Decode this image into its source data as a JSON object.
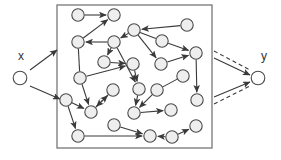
{
  "figure": {
    "type": "network-graph-diagram",
    "title": "",
    "labels": {
      "source": "x",
      "target": "y"
    },
    "colors": {
      "node_fill": "#eeeeee",
      "node_stroke": "#4a4a4a",
      "edge": "#3a3a3a",
      "box_stroke": "#777777",
      "background": "#ffffff",
      "label_text": "#333333"
    },
    "boundary_box": {
      "x": 57,
      "y": 5,
      "width": 155,
      "height": 143
    },
    "node_radius": 6.2,
    "external_nodes": [
      {
        "id": "x",
        "cx": 20,
        "cy": 78,
        "label": "x",
        "label_x": 18,
        "label_y": 60
      },
      {
        "id": "y",
        "cx": 258,
        "cy": 78,
        "label": "y",
        "label_x": 261,
        "label_y": 60
      }
    ],
    "internal_nodes": [
      {
        "id": "n1",
        "cx": 78,
        "cy": 15
      },
      {
        "id": "n2",
        "cx": 114,
        "cy": 15
      },
      {
        "id": "n3",
        "cx": 78,
        "cy": 42
      },
      {
        "id": "n4",
        "cx": 114,
        "cy": 42
      },
      {
        "id": "n5",
        "cx": 104,
        "cy": 62
      },
      {
        "id": "n6",
        "cx": 134,
        "cy": 30
      },
      {
        "id": "n7",
        "cx": 162,
        "cy": 41
      },
      {
        "id": "n8",
        "cx": 187,
        "cy": 25
      },
      {
        "id": "n9",
        "cx": 196,
        "cy": 53
      },
      {
        "id": "n10",
        "cx": 133,
        "cy": 64
      },
      {
        "id": "n11",
        "cx": 161,
        "cy": 64
      },
      {
        "id": "n12",
        "cx": 80,
        "cy": 78
      },
      {
        "id": "n13",
        "cx": 183,
        "cy": 76
      },
      {
        "id": "n14",
        "cx": 139,
        "cy": 89
      },
      {
        "id": "n15",
        "cx": 113,
        "cy": 90
      },
      {
        "id": "n16",
        "cx": 157,
        "cy": 90
      },
      {
        "id": "n17",
        "cx": 197,
        "cy": 100
      },
      {
        "id": "n18",
        "cx": 66,
        "cy": 100
      },
      {
        "id": "n19",
        "cx": 91,
        "cy": 112
      },
      {
        "id": "n20",
        "cx": 134,
        "cy": 113
      },
      {
        "id": "n21",
        "cx": 171,
        "cy": 110
      },
      {
        "id": "n22",
        "cx": 78,
        "cy": 136
      },
      {
        "id": "n23",
        "cx": 114,
        "cy": 125
      },
      {
        "id": "n24",
        "cx": 150,
        "cy": 136
      },
      {
        "id": "n25",
        "cx": 172,
        "cy": 137
      },
      {
        "id": "n26",
        "cx": 196,
        "cy": 126
      }
    ],
    "external_edges": [
      {
        "from": "x",
        "to": "box-top",
        "x1": 30,
        "y1": 70,
        "x2": 57,
        "y2": 50,
        "style": "solid",
        "arrow": true
      },
      {
        "from": "x",
        "to": "n18",
        "x1": 30,
        "y1": 86,
        "x2": 60,
        "y2": 99,
        "style": "solid",
        "arrow": true
      },
      {
        "from": "box-top-right",
        "to": "y",
        "x1": 214,
        "y1": 58,
        "x2": 250,
        "y2": 75,
        "style": "solid",
        "arrow": true
      },
      {
        "from": "box-top-right",
        "to": "y",
        "x1": 214,
        "y1": 51,
        "x2": 250,
        "y2": 70,
        "style": "dashed",
        "arrow": false
      },
      {
        "from": "box-bottom-right",
        "to": "y",
        "x1": 214,
        "y1": 97,
        "x2": 250,
        "y2": 82,
        "style": "solid",
        "arrow": true
      },
      {
        "from": "box-bottom-right",
        "to": "y",
        "x1": 214,
        "y1": 104,
        "x2": 250,
        "y2": 86,
        "style": "dashed",
        "arrow": false
      }
    ],
    "internal_edges": [
      {
        "from": "n1",
        "to": "n2",
        "arrow": true
      },
      {
        "from": "n3",
        "to": "n2",
        "arrow": true
      },
      {
        "from": "n4",
        "to": "n3",
        "arrow": true
      },
      {
        "from": "n6",
        "to": "n4",
        "arrow": true
      },
      {
        "from": "n4",
        "to": "n5",
        "arrow": true
      },
      {
        "from": "n5",
        "to": "n10",
        "arrow": true
      },
      {
        "from": "n8",
        "to": "n6",
        "arrow": true
      },
      {
        "from": "n6",
        "to": "n11",
        "arrow": true
      },
      {
        "from": "n6",
        "to": "n7",
        "arrow": false
      },
      {
        "from": "n7",
        "to": "n9",
        "arrow": true
      },
      {
        "from": "n11",
        "to": "n9",
        "arrow": true
      },
      {
        "from": "n9",
        "to": "n17",
        "arrow": true
      },
      {
        "from": "n3",
        "to": "n12",
        "arrow": false
      },
      {
        "from": "n12",
        "to": "n10",
        "arrow": true
      },
      {
        "from": "n12",
        "to": "n19",
        "arrow": true
      },
      {
        "from": "n10",
        "to": "n14",
        "arrow": true
      },
      {
        "from": "n13",
        "to": "n16",
        "arrow": false
      },
      {
        "from": "n16",
        "to": "n20",
        "arrow": true
      },
      {
        "from": "n15",
        "to": "n19",
        "arrow": true
      },
      {
        "from": "n19",
        "to": "n15",
        "arrow": true
      },
      {
        "from": "n18",
        "to": "n19",
        "arrow": true
      },
      {
        "from": "n18",
        "to": "n22",
        "arrow": true
      },
      {
        "from": "n14",
        "to": "n20",
        "arrow": true
      },
      {
        "from": "n20",
        "to": "n21",
        "arrow": true
      },
      {
        "from": "n23",
        "to": "n24",
        "arrow": true
      },
      {
        "from": "n22",
        "to": "n24",
        "arrow": true
      },
      {
        "from": "n25",
        "to": "n24",
        "arrow": true
      },
      {
        "from": "n25",
        "to": "n26",
        "arrow": true
      },
      {
        "from": "n4",
        "to": "n14",
        "arrow": true
      }
    ]
  },
  "chart_data": {
    "type": "diagram",
    "title": "",
    "node_count_internal": 26,
    "node_count_external": 2,
    "labels": [
      "x",
      "y"
    ]
  }
}
